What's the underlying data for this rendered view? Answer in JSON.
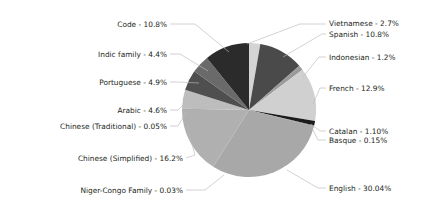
{
  "chart_data": {
    "type": "pie",
    "title": "",
    "subtitle": "",
    "xlabel": "",
    "ylabel": "",
    "legend_position": "callout-labels",
    "grid": false,
    "label_format": "{name} - {value}%",
    "total_percent": 100.0,
    "categories": [
      "Vietnamese",
      "Spanish",
      "Indonesian",
      "French",
      "Catalan",
      "Basque",
      "English",
      "Niger-Congo Family",
      "Chinese (Simplified)",
      "Chinese (Traditional)",
      "Arabic",
      "Portuguese",
      "Indic family",
      "Code"
    ],
    "values": [
      2.7,
      10.8,
      1.2,
      12.9,
      1.1,
      0.15,
      30.04,
      0.03,
      16.2,
      0.05,
      4.6,
      4.9,
      4.4,
      10.8
    ],
    "slices": [
      {
        "name": "Vietnamese",
        "value": 2.7,
        "label": "Vietnamese - 2.7%",
        "color": "#d4d4d4"
      },
      {
        "name": "Spanish",
        "value": 10.8,
        "label": "Spanish - 10.8%",
        "color": "#4a4a4a"
      },
      {
        "name": "Indonesian",
        "value": 1.2,
        "label": "Indonesian - 1.2%",
        "color": "#9b9b9b"
      },
      {
        "name": "French",
        "value": 12.9,
        "label": "French - 12.9%",
        "color": "#d0d0d0"
      },
      {
        "name": "Catalan",
        "value": 1.1,
        "label": "Catalan - 1.10%",
        "color": "#1b1b1b"
      },
      {
        "name": "Basque",
        "value": 0.15,
        "label": "Basque - 0.15%",
        "color": "#6e6e6e"
      },
      {
        "name": "English",
        "value": 30.04,
        "label": "English - 30.04%",
        "color": "#a8a8a8"
      },
      {
        "name": "Niger-Congo Family",
        "value": 0.03,
        "label": "Niger-Congo Family - 0.03%",
        "color": "#8f8f8f"
      },
      {
        "name": "Chinese (Simplified)",
        "value": 16.2,
        "label": "Chinese (Simplified) - 16.2%",
        "color": "#b0b0b0"
      },
      {
        "name": "Chinese (Traditional)",
        "value": 0.05,
        "label": "Chinese (Traditional) - 0.05%",
        "color": "#5a5a5a"
      },
      {
        "name": "Arabic",
        "value": 4.6,
        "label": "Arabic - 4.6%",
        "color": "#bdbdbd"
      },
      {
        "name": "Portuguese",
        "value": 4.9,
        "label": "Portuguese - 4.9%",
        "color": "#4f4f4f"
      },
      {
        "name": "Indic family",
        "value": 4.4,
        "label": "Indic family - 4.4%",
        "color": "#6a6a6a"
      },
      {
        "name": "Code",
        "value": 10.8,
        "label": "Code - 10.8%",
        "color": "#2b2b2b"
      }
    ]
  },
  "labels": {
    "vietnamese": "Vietnamese - 2.7%",
    "spanish": "Spanish - 10.8%",
    "indonesian": "Indonesian - 1.2%",
    "french": "French - 12.9%",
    "catalan": "Catalan - 1.10%",
    "basque": "Basque - 0.15%",
    "english": "English - 30.04%",
    "niger_congo": "Niger-Congo Family - 0.03%",
    "chinese_simplified": "Chinese (Simplified) - 16.2%",
    "chinese_traditional": "Chinese (Traditional) - 0.05%",
    "arabic": "Arabic - 4.6%",
    "portuguese": "Portuguese - 4.9%",
    "indic_family": "Indic family - 4.4%",
    "code": "Code - 10.8%"
  },
  "colors": {
    "text": "#231f20",
    "leader": "#b9b9b9",
    "background": "#ffffff"
  }
}
